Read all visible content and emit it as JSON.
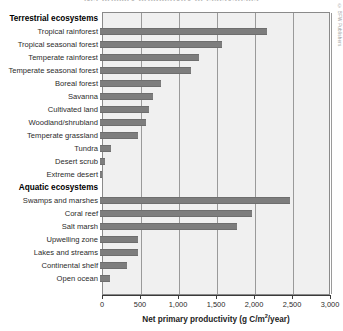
{
  "clipped_title": "Net primary productivity of ecosystems",
  "watermark": "© BFW Publishers",
  "axis": {
    "title_main": "Net primary productivity (g C/m",
    "title_sup": "2",
    "title_tail": "/year)",
    "ticks": [
      "0",
      "500",
      "1,000",
      "1,500",
      "2,000",
      "2,500",
      "3,000"
    ],
    "tick_values": [
      0,
      500,
      1000,
      1500,
      2000,
      2500,
      3000
    ]
  },
  "chart_data": {
    "type": "bar",
    "orientation": "horizontal",
    "title": "Net primary productivity of ecosystems",
    "xlabel": "Net primary productivity (g C/m2/year)",
    "ylabel": "",
    "xlim": [
      0,
      3000
    ],
    "xticks": [
      0,
      500,
      1000,
      1500,
      2000,
      2500,
      3000
    ],
    "xticklabels": [
      "0",
      "500",
      "1,000",
      "1,500",
      "2,000",
      "2,500",
      "3,000"
    ],
    "grid": true,
    "legend": false,
    "bar_color": "#7d7d7d",
    "groups": [
      {
        "name": "Terrestrial ecosystems",
        "categories": [
          "Tropical rainforest",
          "Tropical seasonal forest",
          "Temperate rainforest",
          "Temperate seasonal forest",
          "Boreal forest",
          "Savanna",
          "Cultivated land",
          "Woodland/shrubland",
          "Temperate grassland",
          "Tundra",
          "Desert scrub",
          "Extreme desert"
        ],
        "values": [
          2200,
          1600,
          1300,
          1200,
          800,
          700,
          650,
          600,
          500,
          140,
          70,
          3
        ]
      },
      {
        "name": "Aquatic ecosystems",
        "categories": [
          "Swamps and marshes",
          "Coral reef",
          "Salt marsh",
          "Upwelling zone",
          "Lakes and streams",
          "Continental shelf",
          "Open ocean"
        ],
        "values": [
          2500,
          2000,
          1800,
          500,
          500,
          360,
          125
        ]
      }
    ]
  }
}
